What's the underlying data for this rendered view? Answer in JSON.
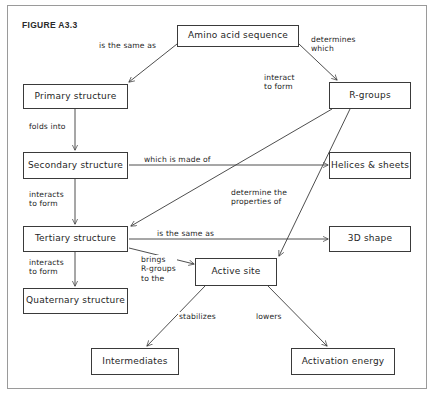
{
  "figure": {
    "caption": "FIGURE A3.3",
    "width": 435,
    "height": 396,
    "stroke_color": "#3a3a3a",
    "border_color": "#9a9a9a",
    "background": "#ffffff"
  },
  "nodes": {
    "amino_acid_sequence": {
      "label": "Amino acid sequence"
    },
    "primary_structure": {
      "label": "Primary structure"
    },
    "r_groups": {
      "label": "R-groups"
    },
    "secondary_structure": {
      "label": "Secondary structure"
    },
    "helices_sheets": {
      "label": "Helices & sheets"
    },
    "tertiary_structure": {
      "label": "Tertiary structure"
    },
    "three_d_shape": {
      "label": "3D shape"
    },
    "quaternary_structure": {
      "label": "Quaternary structure"
    },
    "active_site": {
      "label": "Active site"
    },
    "intermediates": {
      "label": "Intermediates"
    },
    "activation_energy": {
      "label": "Activation energy"
    }
  },
  "edges": {
    "is_the_same_as_primary": {
      "label": "is the same as"
    },
    "determines_which": {
      "label": "determines\nwhich"
    },
    "folds_into": {
      "label": "folds into"
    },
    "interact_to_form": {
      "label": "interact\nto form"
    },
    "which_is_made_of": {
      "label": "which is made of"
    },
    "interacts_to_form_tertiary": {
      "label": "interacts\nto form"
    },
    "determine_the_properties_of": {
      "label": "determine the\nproperties of"
    },
    "is_the_same_as_3d": {
      "label": "is the same as"
    },
    "interacts_to_form_quaternary": {
      "label": "interacts\nto form"
    },
    "brings_r_groups_to_the": {
      "label": "brings\nR-groups\nto the"
    },
    "stabilizes": {
      "label": "stabilizes"
    },
    "lowers": {
      "label": "lowers"
    }
  }
}
